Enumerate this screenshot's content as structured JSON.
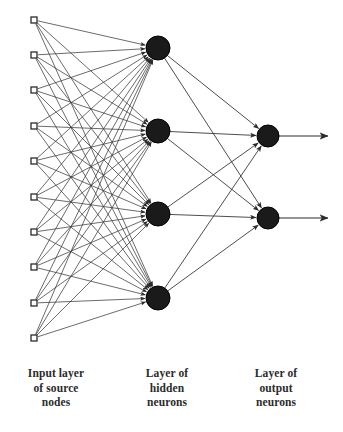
{
  "diagram": {
    "type": "neural-network-architecture",
    "background_color": "#ffffff",
    "ink_color": "#2b2b2b",
    "node_fill_color": "#1a1a1a",
    "input_node_fill": "#ffffff",
    "layers": [
      {
        "id": "input",
        "name": "Input layer of source nodes",
        "node_count": 10,
        "node_shape": "open-square",
        "node_size": 6,
        "center_x": 34,
        "node_y": [
          20,
          55,
          90,
          126,
          161,
          197,
          232,
          267,
          303,
          338
        ]
      },
      {
        "id": "hidden",
        "name": "Layer of hidden neurons",
        "node_count": 4,
        "node_shape": "filled-circle",
        "node_radius": 12,
        "center_x": 158,
        "node_y": [
          48,
          131,
          214,
          298
        ]
      },
      {
        "id": "output",
        "name": "Layer of output neurons",
        "node_count": 2,
        "node_shape": "filled-circle",
        "node_radius": 11,
        "center_x": 268,
        "node_y": [
          136,
          218
        ]
      }
    ],
    "connections": [
      {
        "from": "input",
        "to": "hidden",
        "style": "fully-connected",
        "arrowheads": true
      },
      {
        "from": "hidden",
        "to": "output",
        "style": "fully-connected",
        "arrowheads": true
      }
    ],
    "output_arrows": {
      "count": 2,
      "end_x": 328,
      "y": [
        136,
        218
      ]
    },
    "captions": {
      "input": "Input layer\nof source\nnodes",
      "hidden": "Layer of\nhidden\nneurons",
      "output": "Layer of\noutput\nneurons"
    }
  }
}
